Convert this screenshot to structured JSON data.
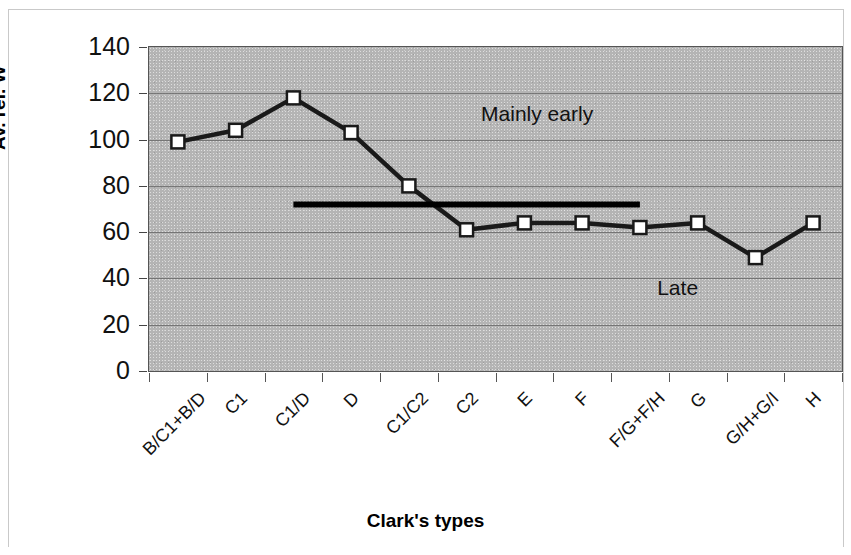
{
  "chart_data": {
    "type": "line",
    "title": "",
    "xlabel": "Clark's types",
    "ylabel": "Av. rel. W",
    "ylim": [
      0,
      140
    ],
    "yticks": [
      0,
      20,
      40,
      60,
      80,
      100,
      120,
      140
    ],
    "grid": true,
    "legend": "none",
    "categories": [
      "B/C1+B/D",
      "C1",
      "C1/D",
      "D",
      "C1/C2",
      "C2",
      "E",
      "F",
      "F/G+F/H",
      "G",
      "G/H+G/I",
      "H"
    ],
    "series": [
      {
        "name": "Av. rel. W",
        "values": [
          99,
          104,
          118,
          103,
          80,
          61,
          64,
          64,
          62,
          64,
          49,
          64
        ],
        "marker": "open-square",
        "color": "#1a1a1a"
      }
    ],
    "reference_line": {
      "label": "threshold",
      "value": 72,
      "start_category_index": 2,
      "end_category_index": 8,
      "color": "#000000"
    },
    "annotations": [
      {
        "text": "Mainly early",
        "x_value": 5.25,
        "y_value": 110
      },
      {
        "text": "Late",
        "x_value": 8.3,
        "y_value": 35
      }
    ],
    "plot_background_color": "#b4b4b4",
    "figure_background_color": "#ffffff"
  }
}
